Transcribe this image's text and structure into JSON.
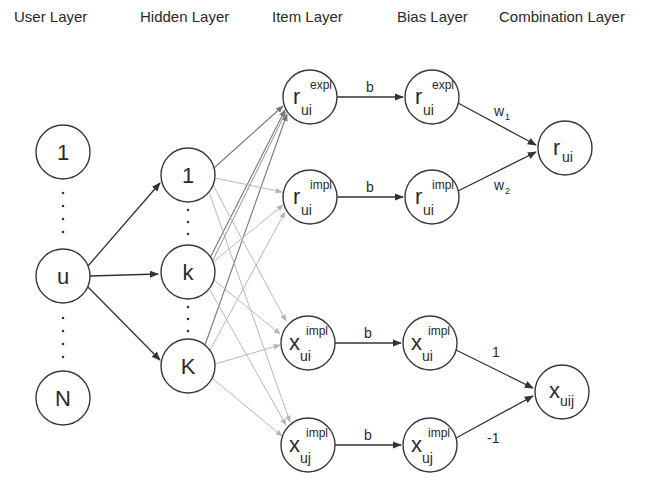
{
  "headers": {
    "user_layer": "User Layer",
    "hidden_layer": "Hidden Layer",
    "item_layer": "Item Layer",
    "bias_layer": "Bias Layer",
    "combination_layer": "Combination Layer"
  },
  "user_nodes": [
    {
      "label": "1"
    },
    {
      "label": "u"
    },
    {
      "label": "N"
    }
  ],
  "hidden_nodes": [
    {
      "label": "1"
    },
    {
      "label": "k"
    },
    {
      "label": "K"
    }
  ],
  "item_nodes": [
    {
      "main": "r",
      "sup": "expl",
      "sub": "ui"
    },
    {
      "main": "r",
      "sup": "impl",
      "sub": "ui"
    },
    {
      "main": "x",
      "sup": "impl",
      "sub": "ui"
    },
    {
      "main": "x",
      "sup": "impl",
      "sub": "uj"
    }
  ],
  "bias_nodes": [
    {
      "main": "r",
      "sup": "expl",
      "sub": "ui"
    },
    {
      "main": "r",
      "sup": "impl",
      "sub": "ui"
    },
    {
      "main": "x",
      "sup": "impl",
      "sub": "ui"
    },
    {
      "main": "x",
      "sup": "impl",
      "sub": "uj"
    }
  ],
  "combination_nodes": [
    {
      "main": "r",
      "sub": "ui"
    },
    {
      "main": "x",
      "sub": "uij"
    }
  ],
  "edge_labels": {
    "bias_1": "b",
    "bias_2": "b",
    "bias_3": "b",
    "bias_4": "b",
    "w1": "w",
    "w1_sub": "1",
    "w2": "w",
    "w2_sub": "2",
    "plus_one": "1",
    "minus_one": "-1"
  },
  "colors": {
    "stroke": "#3a3a3a",
    "dark_edge": "#555555",
    "light_edge": "#b0b0b0"
  }
}
